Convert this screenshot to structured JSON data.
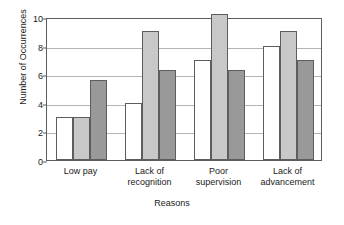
{
  "chart_data": {
    "type": "bar",
    "title": "",
    "xlabel": "Reasons",
    "ylabel": "Number of Occurrences",
    "categories": [
      "Low pay",
      "Lack of recognition",
      "Poor supervision",
      "Lack of advancement"
    ],
    "category_lines": [
      [
        "Low pay"
      ],
      [
        "Lack of",
        "recognition"
      ],
      [
        "Poor",
        "supervision"
      ],
      [
        "Lack of",
        "advancement"
      ]
    ],
    "series": [
      {
        "name": "Series 1",
        "color": "#ffffff",
        "values": [
          3,
          4,
          7,
          8
        ]
      },
      {
        "name": "Series 2",
        "color": "#c8c8c8",
        "values": [
          3,
          9,
          10.2,
          9
        ]
      },
      {
        "name": "Series 3",
        "color": "#999999",
        "values": [
          5.6,
          6.3,
          6.3,
          7
        ]
      }
    ],
    "ylim": [
      0,
      10
    ],
    "yticks": [
      0,
      2,
      4,
      6,
      8,
      10
    ],
    "ytick_labels": [
      "0",
      "2",
      "4",
      "6",
      "8",
      "10"
    ],
    "grid": true,
    "legend": "none",
    "axis_color": "#5d5d5d",
    "grid_color": "#b4b4b4",
    "bar_border_color": "#5d5d5d"
  }
}
